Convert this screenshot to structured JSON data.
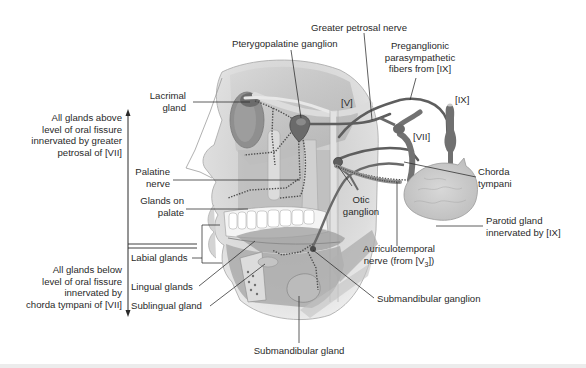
{
  "figure": {
    "colors": {
      "background": "#ffffff",
      "label_text": "#2a2a2a",
      "skin": "#e4e4e4",
      "bone": "#c9c9c9",
      "nerve_dark": "#6b6b6b",
      "nerve_light": "#d8d8d8",
      "gland": "#cfcfcf"
    }
  },
  "left_annotations": {
    "above": {
      "line1": "All glands above",
      "line2": "level of oral fissure",
      "line3": "innervated by greater",
      "line4": "petrosal of [VII]"
    },
    "below": {
      "line1": "All glands below",
      "line2": "level of oral fissure",
      "line3": "innervated by",
      "line4": "chorda tympani of [VII]"
    }
  },
  "labels": {
    "greater_petrosal_nerve": "Greater petrosal nerve",
    "pterygopalatine_ganglion": "Pterygopalatine ganglion",
    "preganglionic": {
      "line1": "Preganglionic",
      "line2": "parasympathetic",
      "line3": "fibers from [IX]"
    },
    "lacrimal_gland": {
      "line1": "Lacrimal",
      "line2": "gland"
    },
    "cn_v": "[V]",
    "cn_vii": "[VII]",
    "cn_ix": "[IX]",
    "palatine_nerve": {
      "line1": "Palatine",
      "line2": "nerve"
    },
    "glands_on_palate": {
      "line1": "Glands on",
      "line2": "palate"
    },
    "chorda_tympani": {
      "line1": "Chorda",
      "line2": "tympani"
    },
    "otic_ganglion": {
      "line1": "Otic",
      "line2": "ganglion"
    },
    "parotid_gland": {
      "line1": "Parotid gland",
      "line2": "innervated by [IX]"
    },
    "auriculotemporal": {
      "line1": "Auriculotemporal",
      "line2_prefix": "nerve (from [V",
      "line2_sub": "3",
      "line2_suffix": "])"
    },
    "labial_glands": "Labial glands",
    "lingual_glands": "Lingual glands",
    "sublingual_gland": "Sublingual gland",
    "submandibular_ganglion": "Submandibular ganglion",
    "submandibular_gland": "Submandibular gland"
  }
}
